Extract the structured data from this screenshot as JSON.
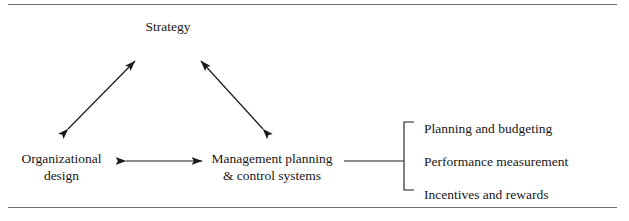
{
  "diagram": {
    "title": "Strategy",
    "nodes": {
      "strategy": "Strategy",
      "organizational_design": "Organizational\ndesign",
      "management_systems": "Management planning\n& control systems"
    },
    "bracket_items": [
      "Planning and budgeting",
      "Performance measurement",
      "Incentives and rewards"
    ],
    "colors": {
      "line": "#1a1a1a",
      "rule": "#6f6f6f",
      "text": "#171717",
      "background": "#ffffff"
    }
  }
}
